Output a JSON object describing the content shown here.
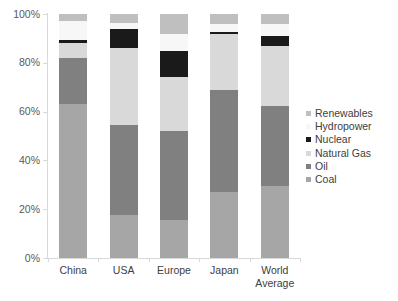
{
  "chart_data": {
    "type": "bar",
    "title": "",
    "subtitle": "",
    "xlabel": "",
    "ylabel": "",
    "stacked": true,
    "grid": false,
    "legend_position": "right",
    "ylim": [
      0,
      100
    ],
    "ytick_labels": [
      "100%",
      "80%",
      "60%",
      "40%",
      "20%",
      "0%"
    ],
    "ytick_values": [
      100,
      80,
      60,
      40,
      20,
      0
    ],
    "categories": [
      "China",
      "USA",
      "Europe",
      "Japan",
      "World Average"
    ],
    "category_lines": [
      [
        "China"
      ],
      [
        "USA"
      ],
      [
        "Europe"
      ],
      [
        "Japan"
      ],
      [
        "World",
        "Average"
      ]
    ],
    "series": [
      {
        "name": "Coal",
        "color": "#a6a6a6",
        "values": [
          63.0,
          17.5,
          15.5,
          27.0,
          29.5
        ]
      },
      {
        "name": "Oil",
        "color": "#808080",
        "values": [
          19.0,
          37.0,
          36.5,
          42.0,
          33.0
        ]
      },
      {
        "name": "Natural Gas",
        "color": "#d9d9d9",
        "values": [
          6.0,
          31.5,
          22.0,
          23.0,
          24.5
        ]
      },
      {
        "name": "Nuclear",
        "color": "#1a1a1a",
        "values": [
          1.5,
          8.0,
          11.0,
          0.8,
          4.0
        ]
      },
      {
        "name": "Hydropower",
        "color": "#f7f7f7",
        "values": [
          7.5,
          2.5,
          7.0,
          3.2,
          5.0
        ]
      },
      {
        "name": "Renewables",
        "color": "#bfbfbf",
        "values": [
          3.0,
          3.5,
          8.0,
          4.0,
          4.0
        ]
      }
    ],
    "legend_entries": [
      {
        "label": "Renewables",
        "color": "#bfbfbf"
      },
      {
        "label": "Hydropower",
        "color": "#f7f7f7"
      },
      {
        "label": "Nuclear",
        "color": "#1a1a1a"
      },
      {
        "label": "Natural Gas",
        "color": "#d9d9d9"
      },
      {
        "label": "Oil",
        "color": "#808080"
      },
      {
        "label": "Coal",
        "color": "#a6a6a6"
      }
    ],
    "axis_color": "#d9d9d9"
  }
}
